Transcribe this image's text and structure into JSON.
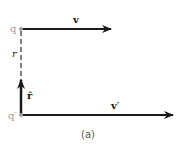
{
  "diagram": {
    "points": {
      "q": "q",
      "q_prime": "q′"
    },
    "vectors": {
      "v": "v",
      "v_prime": "v′",
      "r_hat": "r̂",
      "r": "r"
    },
    "caption": "(a)",
    "colors": {
      "arrow": "#1a1a1a",
      "point": "#a0a0a0",
      "dashed": "#555555"
    }
  }
}
